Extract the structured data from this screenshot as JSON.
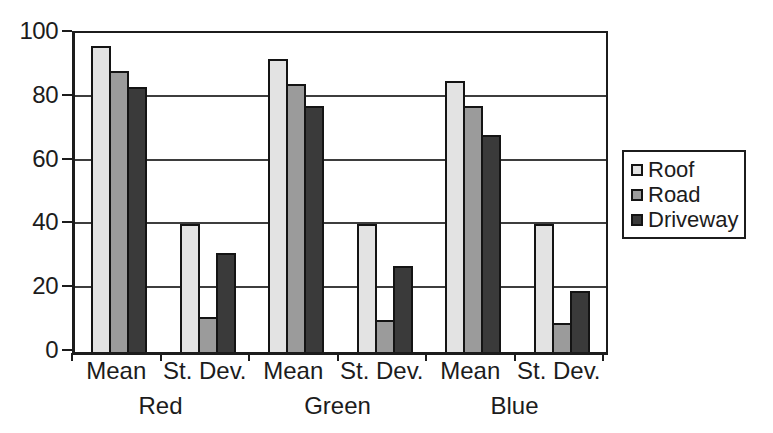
{
  "chart_data": {
    "type": "bar",
    "title": "",
    "xlabel": "",
    "ylabel": "",
    "ylim": [
      0,
      100
    ],
    "yticks": [
      0,
      20,
      40,
      60,
      80,
      100
    ],
    "gridlines": [
      20,
      40,
      60,
      80
    ],
    "grid": true,
    "legend_position": "right",
    "categories": [
      "Mean",
      "St. Dev.",
      "Mean",
      "St. Dev.",
      "Mean",
      "St. Dev."
    ],
    "groups": [
      {
        "label": "Red"
      },
      {
        "label": "Green"
      },
      {
        "label": "Blue"
      }
    ],
    "series": [
      {
        "name": "Roof",
        "color": "#e3e3e3",
        "values": [
          96,
          40,
          92,
          40,
          85,
          40
        ]
      },
      {
        "name": "Road",
        "color": "#9b9b9b",
        "values": [
          88,
          11,
          84,
          10,
          77,
          9
        ]
      },
      {
        "name": "Driveway",
        "color": "#3a3a3a",
        "values": [
          83,
          31,
          77,
          27,
          68,
          19
        ]
      }
    ],
    "colors": {
      "axis": "#1c1c1c",
      "gridline": "#3d3d3d",
      "background": "#ffffff",
      "text": "#1c1c1c"
    }
  }
}
